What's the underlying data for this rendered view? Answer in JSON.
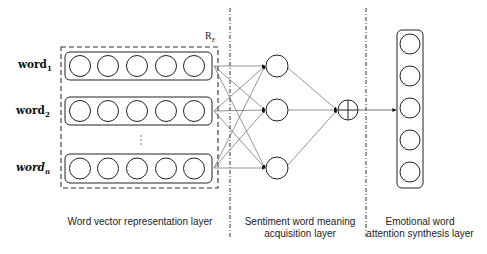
{
  "diagram": {
    "type": "neural-network-architecture",
    "inputs": [
      {
        "base": "word",
        "sub": "1",
        "italic": false
      },
      {
        "base": "word",
        "sub": "2",
        "italic": false
      },
      {
        "base": "word",
        "sub": "n",
        "italic": true
      }
    ],
    "ellipsis": "⋮",
    "embedding_label": {
      "base": "R",
      "sub": "E"
    },
    "nodes_per_vector": 5,
    "hidden_nodes": 3,
    "sum_node": "⊕",
    "output_nodes": 5,
    "layers": [
      {
        "name": "word-vector",
        "label_line1": "Word vector representation layer",
        "label_line2": ""
      },
      {
        "name": "sentiment",
        "label_line1": "Sentiment word meaning",
        "label_line2": "acquisition layer"
      },
      {
        "name": "attention",
        "label_line1": "Emotional word",
        "label_line2": "attention synthesis layer"
      }
    ],
    "colors": {
      "stroke": "#222222",
      "edge": "#555555",
      "background": "#ffffff"
    }
  }
}
